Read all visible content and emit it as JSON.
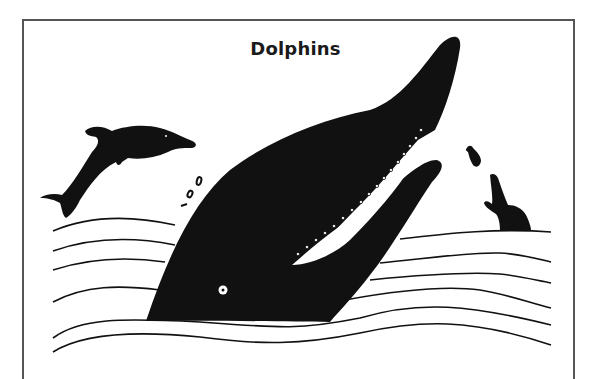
{
  "illustration": {
    "title": "Dolphins",
    "colors": {
      "ink": "#111111",
      "frame": "#555555",
      "background": "#ffffff"
    },
    "elements": [
      "leaping-dolphin",
      "large-dolphin-head",
      "small-dolphin-with-fish",
      "fish",
      "water-splash-drops",
      "wave-lines"
    ]
  }
}
